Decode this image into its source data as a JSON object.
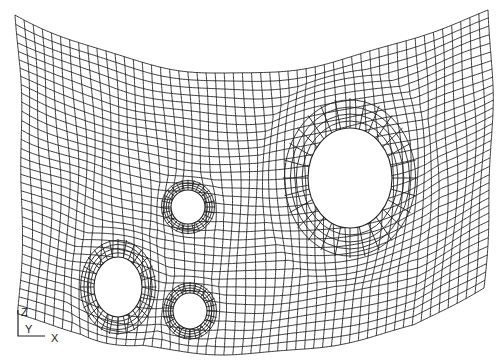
{
  "figure": {
    "line_color": "#222222",
    "background": "#ffffff"
  },
  "mesh": {
    "columns": 52,
    "rows": 34,
    "holes": [
      {
        "name": "large-hole",
        "relative_size": "large"
      },
      {
        "name": "upper-small-hole",
        "relative_size": "small"
      },
      {
        "name": "lower-left-hole",
        "relative_size": "medium"
      },
      {
        "name": "lower-middle-hole",
        "relative_size": "small"
      }
    ]
  },
  "axis_triad": {
    "vertical": "Z",
    "depth": "Y",
    "horizontal": "X"
  }
}
